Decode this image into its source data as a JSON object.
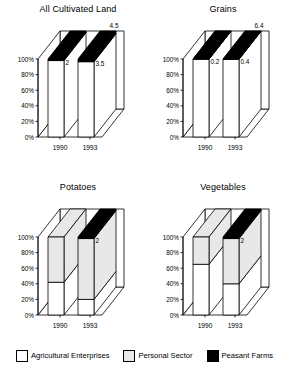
{
  "legend": {
    "items": [
      {
        "label": "Agricultural Enterprises",
        "color": "#ffffff",
        "swatch": "white"
      },
      {
        "label": "Personal Sector",
        "color": "#e8e8e8",
        "swatch": "gray"
      },
      {
        "label": "Peasant Farms",
        "color": "#000000",
        "swatch": "black"
      }
    ]
  },
  "chart_data": [
    {
      "type": "bar",
      "title": "All Cultivated Land",
      "xlabel": "",
      "ylabel": "",
      "categories": [
        "1990",
        "1993"
      ],
      "ytick_labels": [
        "0%",
        "20%",
        "40%",
        "60%",
        "80%",
        "100%"
      ],
      "ytick_values": [
        0,
        20,
        40,
        60,
        80,
        100
      ],
      "ylim": [
        0,
        100
      ],
      "stacked": true,
      "three_d": true,
      "grid": false,
      "legend_position": "bottom",
      "series": [
        {
          "name": "Agricultural Enterprises",
          "color": "#ffffff",
          "values": [
            98,
            96.5
          ]
        },
        {
          "name": "Personal Sector",
          "color": "#e8e8e8",
          "values": [
            0,
            0
          ]
        },
        {
          "name": "Peasant Farms",
          "color": "#000000",
          "values": [
            2,
            3.5
          ]
        }
      ],
      "annotations": [
        {
          "text": "2",
          "category": "1990",
          "series": "Peasant Farms"
        },
        {
          "text": "3.5",
          "category": "1993",
          "series": "Peasant Farms"
        },
        {
          "text": "4.5",
          "category": "1993",
          "series": "top-right"
        }
      ]
    },
    {
      "type": "bar",
      "title": "Grains",
      "xlabel": "",
      "ylabel": "",
      "categories": [
        "1990",
        "1993"
      ],
      "ytick_labels": [
        "0%",
        "20%",
        "40%",
        "60%",
        "80%",
        "100%"
      ],
      "ytick_values": [
        0,
        20,
        40,
        60,
        80,
        100
      ],
      "ylim": [
        0,
        100
      ],
      "stacked": true,
      "three_d": true,
      "grid": false,
      "legend_position": "bottom",
      "series": [
        {
          "name": "Agricultural Enterprises",
          "color": "#ffffff",
          "values": [
            99.8,
            99.6
          ]
        },
        {
          "name": "Personal Sector",
          "color": "#e8e8e8",
          "values": [
            0,
            0
          ]
        },
        {
          "name": "Peasant Farms",
          "color": "#000000",
          "values": [
            0.2,
            0.4
          ]
        }
      ],
      "annotations": [
        {
          "text": "0.2",
          "category": "1990",
          "series": "Peasant Farms"
        },
        {
          "text": "6.4",
          "category": "1993",
          "series": "top-right"
        },
        {
          "text": "0.4",
          "category": "1993",
          "series": "Peasant Farms"
        }
      ]
    },
    {
      "type": "bar",
      "title": "Potatoes",
      "xlabel": "",
      "ylabel": "",
      "categories": [
        "1990",
        "1993"
      ],
      "ytick_labels": [
        "0%",
        "20%",
        "40%",
        "60%",
        "80%",
        "100%"
      ],
      "ytick_values": [
        0,
        20,
        40,
        60,
        80,
        100
      ],
      "ylim": [
        0,
        100
      ],
      "stacked": true,
      "three_d": true,
      "grid": false,
      "legend_position": "bottom",
      "series": [
        {
          "name": "Agricultural Enterprises",
          "color": "#ffffff",
          "values": [
            42,
            20
          ]
        },
        {
          "name": "Personal Sector",
          "color": "#e8e8e8",
          "values": [
            58,
            78
          ]
        },
        {
          "name": "Peasant Farms",
          "color": "#000000",
          "values": [
            0,
            2
          ]
        }
      ],
      "annotations": [
        {
          "text": "2",
          "category": "1993",
          "series": "Peasant Farms"
        }
      ]
    },
    {
      "type": "bar",
      "title": "Vegetables",
      "xlabel": "",
      "ylabel": "",
      "categories": [
        "1990",
        "1993"
      ],
      "ytick_labels": [
        "0%",
        "20%",
        "40%",
        "60%",
        "80%",
        "100%"
      ],
      "ytick_values": [
        0,
        20,
        40,
        60,
        80,
        100
      ],
      "ylim": [
        0,
        100
      ],
      "stacked": true,
      "three_d": true,
      "grid": false,
      "legend_position": "bottom",
      "series": [
        {
          "name": "Agricultural Enterprises",
          "color": "#ffffff",
          "values": [
            65,
            40
          ]
        },
        {
          "name": "Personal Sector",
          "color": "#e8e8e8",
          "values": [
            35,
            58
          ]
        },
        {
          "name": "Peasant Farms",
          "color": "#000000",
          "values": [
            0,
            2
          ]
        }
      ],
      "annotations": [
        {
          "text": "2",
          "category": "1993",
          "series": "Peasant Farms"
        }
      ]
    }
  ]
}
